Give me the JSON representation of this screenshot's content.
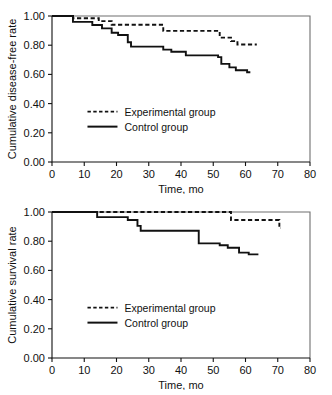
{
  "figure": {
    "cut_header_text": "",
    "panel_count": 2
  },
  "chart_data": [
    {
      "id": "disease-free",
      "type": "line",
      "subtype": "kaplan-meier-step",
      "title": "",
      "xlabel": "Time, mo",
      "ylabel": "Cumulative disease-free rate",
      "xlim": [
        0,
        80
      ],
      "ylim": [
        0.0,
        1.0
      ],
      "xticks": [
        0,
        10,
        20,
        30,
        40,
        50,
        60,
        70,
        80
      ],
      "xticklabels": [
        "0",
        "10",
        "20",
        "30",
        "40",
        "50",
        "60",
        "70",
        "80"
      ],
      "yticks": [
        0.0,
        0.2,
        0.4,
        0.6,
        0.8,
        1.0
      ],
      "yticklabels": [
        "0.00",
        "0.20",
        "0.40",
        "0.60",
        "0.80",
        "1.00"
      ],
      "grid": false,
      "legend_position": "center-left",
      "series": [
        {
          "name": "Experimental group",
          "style": "dashed",
          "color": "#111111",
          "points": [
            {
              "x": 0,
              "y": 1.0
            },
            {
              "x": 6.5,
              "y": 1.0
            },
            {
              "x": 6.5,
              "y": 0.985
            },
            {
              "x": 14.5,
              "y": 0.985
            },
            {
              "x": 14.5,
              "y": 0.965
            },
            {
              "x": 18.5,
              "y": 0.965
            },
            {
              "x": 18.5,
              "y": 0.94
            },
            {
              "x": 34.5,
              "y": 0.94
            },
            {
              "x": 34.5,
              "y": 0.898
            },
            {
              "x": 52.0,
              "y": 0.898
            },
            {
              "x": 52.0,
              "y": 0.852
            },
            {
              "x": 55.5,
              "y": 0.852
            },
            {
              "x": 55.5,
              "y": 0.828
            },
            {
              "x": 57.5,
              "y": 0.828
            },
            {
              "x": 57.5,
              "y": 0.805
            },
            {
              "x": 63.5,
              "y": 0.805
            }
          ]
        },
        {
          "name": "Control group",
          "style": "solid",
          "color": "#111111",
          "points": [
            {
              "x": 0,
              "y": 1.0
            },
            {
              "x": 6.5,
              "y": 1.0
            },
            {
              "x": 6.5,
              "y": 0.96
            },
            {
              "x": 12.5,
              "y": 0.96
            },
            {
              "x": 12.5,
              "y": 0.938
            },
            {
              "x": 15.5,
              "y": 0.938
            },
            {
              "x": 15.5,
              "y": 0.915
            },
            {
              "x": 18.5,
              "y": 0.915
            },
            {
              "x": 18.5,
              "y": 0.885
            },
            {
              "x": 20.5,
              "y": 0.885
            },
            {
              "x": 20.5,
              "y": 0.87
            },
            {
              "x": 23.5,
              "y": 0.87
            },
            {
              "x": 23.5,
              "y": 0.82
            },
            {
              "x": 24.5,
              "y": 0.82
            },
            {
              "x": 24.5,
              "y": 0.79
            },
            {
              "x": 34.5,
              "y": 0.79
            },
            {
              "x": 34.5,
              "y": 0.77
            },
            {
              "x": 37.0,
              "y": 0.77
            },
            {
              "x": 37.0,
              "y": 0.755
            },
            {
              "x": 41.5,
              "y": 0.755
            },
            {
              "x": 41.5,
              "y": 0.73
            },
            {
              "x": 51.5,
              "y": 0.73
            },
            {
              "x": 51.5,
              "y": 0.718
            },
            {
              "x": 52.5,
              "y": 0.718
            },
            {
              "x": 52.5,
              "y": 0.672
            },
            {
              "x": 55.0,
              "y": 0.672
            },
            {
              "x": 55.0,
              "y": 0.648
            },
            {
              "x": 57.0,
              "y": 0.648
            },
            {
              "x": 57.0,
              "y": 0.628
            },
            {
              "x": 60.5,
              "y": 0.628
            },
            {
              "x": 60.5,
              "y": 0.615
            },
            {
              "x": 61.5,
              "y": 0.615
            }
          ]
        }
      ]
    },
    {
      "id": "survival",
      "type": "line",
      "subtype": "kaplan-meier-step",
      "title": "",
      "xlabel": "Time, mo",
      "ylabel": "Cumulative survival rate",
      "xlim": [
        0,
        80
      ],
      "ylim": [
        0.0,
        1.0
      ],
      "xticks": [
        0,
        10,
        20,
        30,
        40,
        50,
        60,
        70,
        80
      ],
      "xticklabels": [
        "0",
        "10",
        "20",
        "30",
        "40",
        "50",
        "60",
        "70",
        "80"
      ],
      "yticks": [
        0.0,
        0.2,
        0.4,
        0.6,
        0.8,
        1.0
      ],
      "yticklabels": [
        "0.00",
        "0.20",
        "0.40",
        "0.60",
        "0.80",
        "1.00"
      ],
      "grid": false,
      "legend_position": "center-left",
      "series": [
        {
          "name": "Experimental group",
          "style": "dashed",
          "color": "#111111",
          "points": [
            {
              "x": 0,
              "y": 1.0
            },
            {
              "x": 14.0,
              "y": 1.0
            },
            {
              "x": 55.5,
              "y": 1.0
            },
            {
              "x": 55.5,
              "y": 0.945
            },
            {
              "x": 70.5,
              "y": 0.945
            },
            {
              "x": 70.5,
              "y": 0.89
            },
            {
              "x": 71.0,
              "y": 0.89
            }
          ]
        },
        {
          "name": "Control group",
          "style": "solid",
          "color": "#111111",
          "points": [
            {
              "x": 0,
              "y": 1.0
            },
            {
              "x": 14.0,
              "y": 1.0
            },
            {
              "x": 14.0,
              "y": 0.965
            },
            {
              "x": 23.5,
              "y": 0.965
            },
            {
              "x": 23.5,
              "y": 0.945
            },
            {
              "x": 26.5,
              "y": 0.945
            },
            {
              "x": 26.5,
              "y": 0.905
            },
            {
              "x": 27.5,
              "y": 0.905
            },
            {
              "x": 27.5,
              "y": 0.872
            },
            {
              "x": 45.5,
              "y": 0.872
            },
            {
              "x": 45.5,
              "y": 0.785
            },
            {
              "x": 52.0,
              "y": 0.785
            },
            {
              "x": 52.0,
              "y": 0.772
            },
            {
              "x": 54.5,
              "y": 0.772
            },
            {
              "x": 54.5,
              "y": 0.755
            },
            {
              "x": 58.0,
              "y": 0.755
            },
            {
              "x": 58.0,
              "y": 0.722
            },
            {
              "x": 61.0,
              "y": 0.722
            },
            {
              "x": 61.0,
              "y": 0.71
            },
            {
              "x": 64.0,
              "y": 0.71
            }
          ]
        }
      ]
    }
  ]
}
